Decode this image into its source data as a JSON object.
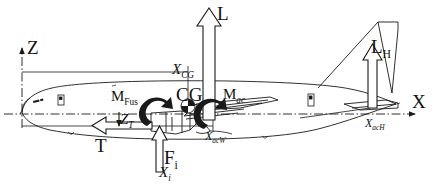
{
  "figure": {
    "type": "aircraft-free-body-diagram",
    "ink_color": "#1a1a1a",
    "background_color": "#ffffff"
  },
  "axes": {
    "vertical": {
      "name": "Z",
      "label": "Z",
      "direction": "up"
    },
    "horizontal": {
      "name": "X",
      "label": "X",
      "direction": "right"
    }
  },
  "forces": [
    {
      "key": "wing_lift",
      "label": "L",
      "sub": "",
      "direction": "up",
      "style": "hollow-arrow"
    },
    {
      "key": "tail_lift",
      "label": "L",
      "sub": "H",
      "direction": "up",
      "style": "hollow-arrow"
    },
    {
      "key": "thrust",
      "label": "T",
      "sub": "",
      "direction": "left",
      "style": "hollow-arrow"
    },
    {
      "key": "engine_normal_force",
      "label": "F",
      "sub": "i",
      "direction": "up",
      "style": "hollow-arrow"
    }
  ],
  "moments": [
    {
      "key": "fuselage_moment",
      "label": "M",
      "sub": "Fus",
      "sense": "nose-up",
      "style": "solid-curved-arrow"
    },
    {
      "key": "wing_ac_moment",
      "label": "M",
      "sub": "ac",
      "sense": "nose-up",
      "style": "solid-curved-arrow"
    }
  ],
  "stations": [
    {
      "key": "cg_station",
      "label": "X",
      "sub": "CG"
    },
    {
      "key": "wing_ac_station",
      "label": "X",
      "sub": "acW"
    },
    {
      "key": "tail_ac_station",
      "label": "X",
      "sub": "acH"
    },
    {
      "key": "engine_station",
      "label": "X",
      "sub": "i"
    }
  ],
  "offsets": [
    {
      "key": "thrust_vertical_offset",
      "label": "Z",
      "sub": "T"
    }
  ],
  "markers": [
    {
      "key": "center_of_gravity",
      "label": "CG",
      "symbol": "quartered-circle"
    }
  ]
}
